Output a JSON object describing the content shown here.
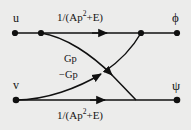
{
  "figure": {
    "type": "signal-flow-graph",
    "background_color": "#ececeb",
    "line_color": "#101010",
    "width": 191,
    "height": 130
  },
  "nodes": {
    "input_top": "u",
    "input_bottom": "v",
    "output_top": "ϕ",
    "output_bottom": "ψ"
  },
  "branches": {
    "top_transfer": {
      "prefix": "1/(Ap",
      "exponent": "2",
      "suffix": "+E)"
    },
    "bottom_transfer": {
      "prefix": "1/(Ap",
      "exponent": "2",
      "suffix": "+E)"
    },
    "cross_down": "Gp",
    "cross_up": "−Gp"
  },
  "graph_data": {
    "type": "diagram",
    "description": "Signal flow graph with two parallel forward paths and two cross-coupling branches",
    "vertices": [
      {
        "id": "u",
        "label": "u",
        "x": 15,
        "y": 33,
        "dot": true
      },
      {
        "id": "n1",
        "label": "",
        "x": 41,
        "y": 33,
        "dot": true
      },
      {
        "id": "n2",
        "label": "",
        "x": 141,
        "y": 33,
        "dot": true
      },
      {
        "id": "phi",
        "label": "ϕ",
        "x": 177,
        "y": 33,
        "dot": true
      },
      {
        "id": "v",
        "label": "v",
        "x": 16,
        "y": 100,
        "dot": true
      },
      {
        "id": "n3",
        "label": "",
        "x": 136,
        "y": 100,
        "dot": false
      },
      {
        "id": "psi",
        "label": "ψ",
        "x": 177,
        "y": 100,
        "dot": true
      }
    ],
    "edges": [
      {
        "from": "u",
        "to": "phi",
        "label": "1/(Ap^2+E)",
        "shape": "straight",
        "arrow_at": 105
      },
      {
        "from": "v",
        "to": "psi",
        "label": "1/(Ap^2+E)",
        "shape": "straight",
        "arrow_at": 103
      },
      {
        "from": "n1",
        "to": "n3",
        "label": "Gp",
        "shape": "curved"
      },
      {
        "from": "v",
        "to": "n2",
        "label": "-Gp",
        "shape": "curved"
      }
    ]
  }
}
